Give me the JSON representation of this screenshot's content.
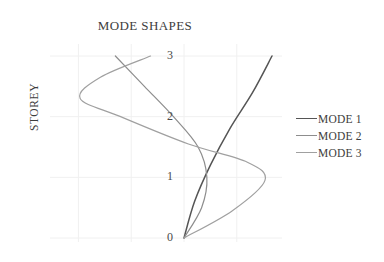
{
  "chart_data": {
    "type": "line",
    "title": "MODE SHAPES",
    "xlabel": "",
    "ylabel": "STOREY",
    "grid": true,
    "legend_position": "right",
    "y_ticks": [
      "0",
      "1",
      "2",
      "3"
    ],
    "y_values": [
      0,
      1,
      2,
      3
    ],
    "ylim": [
      0,
      3
    ],
    "xlim": [
      -1.2,
      1.2
    ],
    "x_axis_visible": false,
    "series": [
      {
        "name": "MODE 1",
        "color": "#555555",
        "x": [
          0,
          0.12,
          0.3,
          0.52,
          0.78,
          1.0
        ],
        "storey": [
          0,
          0.6,
          1.2,
          1.8,
          2.4,
          3.0
        ]
      },
      {
        "name": "MODE 2",
        "color": "#8d8d8d",
        "x": [
          0,
          0.2,
          0.26,
          0.16,
          -0.12,
          -0.45,
          -0.78
        ],
        "storey": [
          0,
          0.5,
          1.0,
          1.5,
          2.0,
          2.5,
          3.0
        ]
      },
      {
        "name": "MODE 3",
        "color": "#a0a0a0",
        "x": [
          0,
          0.55,
          0.92,
          0.72,
          0.05,
          -0.72,
          -1.18,
          -0.95,
          -0.38
        ],
        "storey": [
          0,
          0.45,
          0.95,
          1.25,
          1.55,
          2.0,
          2.3,
          2.65,
          3.0
        ]
      }
    ],
    "legend_entries": [
      "MODE 1",
      "MODE 2",
      "MODE 3"
    ]
  },
  "chart": {
    "title": "MODE SHAPES",
    "y_axis_title": "STOREY"
  },
  "colors": {
    "mode1": "#555555",
    "mode2": "#8d8d8d",
    "mode3": "#a0a0a0",
    "grid": "#f0f0f0",
    "text": "#3d3d3d",
    "background": "#ffffff"
  }
}
